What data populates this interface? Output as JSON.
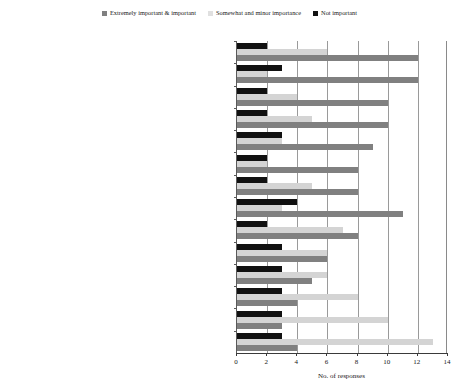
{
  "legend": {
    "position": "top-center",
    "entries": [
      {
        "label": "Extremely important & important",
        "color": "#808080",
        "icon": "square-swatch"
      },
      {
        "label": "Somewhat and minor importance",
        "color": "#d4d4d4",
        "icon": "square-swatch"
      },
      {
        "label": "Not important",
        "color": "#111111",
        "icon": "square-swatch"
      }
    ]
  },
  "chart_data": {
    "type": "bar",
    "orientation": "horizontal",
    "title": "",
    "xlabel": "No. of responses",
    "ylabel": "",
    "xlim": [
      0,
      14
    ],
    "xticks": [
      0,
      2,
      4,
      6,
      8,
      10,
      12,
      14
    ],
    "grid": true,
    "categories": [
      "Limited interaction between contracting and procurement and the environmental teams in the business",
      "Suppliers have a limited understanding of your business",
      "Insufficient time and resources to dedicate to managing suppliers effectively",
      "Preferred vendor status and programs",
      "There is little or no incentive for suppliers to provide exceedingly high levels of service",
      "Suppliers are not seen by the business as strategically important",
      "Absence of industry drivers to change the status quo",
      "Lack of trust that suppliers can enhance performance and respond to business' needs",
      "No long term plan for ongoing engagement with suppliers",
      "Limited contractor management skills in the business",
      "Absence of strong competition (among suppliers)",
      "Engaging with suppliers is a relatively low priority for the business",
      "A transactional approach to procuring goods and services from suppliers",
      "Policies preclude assessment of supplier's potential contribution to sustainable development"
    ],
    "series": [
      {
        "name": "Extremely important & important",
        "color": "#808080",
        "values": [
          12,
          12,
          10,
          10,
          9,
          8,
          8,
          11,
          8,
          6,
          5,
          4,
          3,
          4
        ]
      },
      {
        "name": "Somewhat and minor importance",
        "color": "#d4d4d4",
        "values": [
          6,
          2,
          4,
          5,
          3,
          2,
          5,
          3,
          7,
          6,
          6,
          8,
          10,
          13
        ]
      },
      {
        "name": "Not important",
        "color": "#111111",
        "values": [
          2,
          3,
          2,
          2,
          3,
          2,
          2,
          4,
          2,
          3,
          3,
          3,
          3,
          3
        ]
      }
    ]
  }
}
